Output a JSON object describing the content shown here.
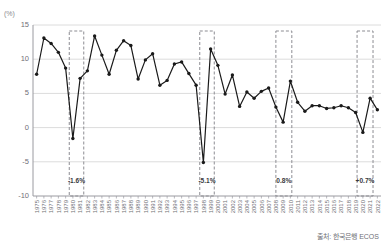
{
  "header": {
    "title": "",
    "y_unit_label": "(%)"
  },
  "source": {
    "text": "출처: 한국은행 ECOS"
  },
  "chart_data": {
    "type": "line",
    "title": "",
    "xlabel": "",
    "ylabel": "(%)",
    "ylim": [
      -10,
      15
    ],
    "yticks": [
      15,
      10,
      5,
      0,
      -5,
      -10
    ],
    "grid": true,
    "legend": "none",
    "marker": "circle",
    "line_color": "#1a1a1a",
    "marker_color": "#1a1a1a",
    "grid_color": "#dcdcdc",
    "annotation_box_color": "#8c8c92",
    "categories": [
      "1975",
      "1976",
      "1977",
      "1978",
      "1979",
      "1980",
      "1981",
      "1982",
      "1983",
      "1984",
      "1985",
      "1986",
      "1987",
      "1988",
      "1989",
      "1990",
      "1991",
      "1992",
      "1993",
      "1994",
      "1995",
      "1996",
      "1997",
      "1998",
      "1999",
      "2000",
      "2001",
      "2002",
      "2003",
      "2004",
      "2005",
      "2006",
      "2007",
      "2008",
      "2009",
      "2010",
      "2011",
      "2012",
      "2013",
      "2014",
      "2015",
      "2016",
      "2017",
      "2018",
      "2019",
      "2020",
      "2021",
      "2022"
    ],
    "values": [
      7.8,
      13.1,
      12.3,
      11.0,
      8.7,
      -1.6,
      7.2,
      8.3,
      13.4,
      10.6,
      7.8,
      11.3,
      12.7,
      12.0,
      7.1,
      9.9,
      10.8,
      6.2,
      6.9,
      9.3,
      9.6,
      7.9,
      6.2,
      -5.1,
      11.5,
      9.1,
      4.9,
      7.7,
      3.1,
      5.2,
      4.3,
      5.3,
      5.8,
      3.0,
      0.8,
      6.8,
      3.7,
      2.4,
      3.2,
      3.2,
      2.8,
      2.9,
      3.2,
      2.9,
      2.2,
      -0.7,
      4.3,
      2.6
    ],
    "annotations": [
      {
        "label": "-1.6%",
        "year": "1980",
        "index": 5
      },
      {
        "label": "-5.1%",
        "year": "1998",
        "index": 23
      },
      {
        "label": "0.8%",
        "year": "2009",
        "index": 34
      },
      {
        "label": "+0.7%",
        "year": "2020",
        "index": 45
      }
    ],
    "annotation_bands": [
      {
        "start_index": 4.5,
        "end_index": 6.5,
        "label": "-1.6%"
      },
      {
        "start_index": 22.5,
        "end_index": 24.5,
        "label": "-5.1%"
      },
      {
        "start_index": 33.0,
        "end_index": 35.2,
        "label": "0.8%"
      },
      {
        "start_index": 44.2,
        "end_index": 46.4,
        "label": "+0.7%"
      }
    ]
  }
}
